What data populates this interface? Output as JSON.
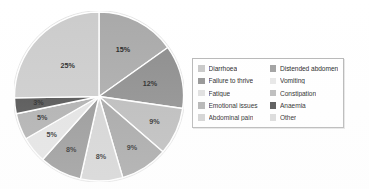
{
  "chart_data": {
    "type": "pie",
    "title": "",
    "subtitle": "",
    "xlabel": "",
    "ylabel": "",
    "grid": false,
    "legend_position": "right",
    "start_angle_deg": 0,
    "direction": "clockwise",
    "categories": [
      "Diarrhoea",
      "Distended abdomen",
      "Failure to thrive",
      "Vomiting",
      "Fatigue",
      "Constipation",
      "Emotional issues",
      "Anaemia",
      "Abdominal pain",
      "Other"
    ],
    "values": [
      15,
      12,
      9,
      9,
      8,
      8,
      5,
      5,
      3,
      25
    ],
    "value_unit": "%",
    "total_labeled": 99,
    "slices": [
      {
        "label": "Diarrhoea",
        "value": 15,
        "value_label": "15%",
        "color": "#a8a8a8"
      },
      {
        "label": "Distended abdomen",
        "value": 12,
        "value_label": "12%",
        "color": "#8a8a8a"
      },
      {
        "label": "Failure to thrive",
        "value": 9,
        "value_label": "9%",
        "color": "#b9b9b9"
      },
      {
        "label": "Vomiting",
        "value": 9,
        "value_label": "9%",
        "color": "#a2a2a2"
      },
      {
        "label": "Fatigue",
        "value": 8,
        "value_label": "8%",
        "color": "#d2d2d2"
      },
      {
        "label": "Constipation",
        "value": 8,
        "value_label": "8%",
        "color": "#939393"
      },
      {
        "label": "Emotional issues",
        "value": 5,
        "value_label": "5%",
        "color": "#e2e2e2"
      },
      {
        "label": "Anaemia",
        "value": 5,
        "value_label": "5%",
        "color": "#acacac"
      },
      {
        "label": "Abdominal pain",
        "value": 3,
        "value_label": "3%",
        "color": "#4a4a4a"
      },
      {
        "label": "Other",
        "value": 25,
        "value_label": "25%",
        "color": "#cbcbcb"
      }
    ]
  },
  "legend": {
    "columns": [
      {
        "items": [
          {
            "label": "Diarrhoea",
            "color": "#c6c6c6"
          },
          {
            "label": "Failure to thrive",
            "color": "#8f8f8f"
          },
          {
            "label": "Fatigue",
            "color": "#dedede"
          },
          {
            "label": "Emotional issues",
            "color": "#b0b0b0"
          },
          {
            "label": "Abdominal pain",
            "color": "#d0d0d0"
          }
        ]
      },
      {
        "items": [
          {
            "label": "Distended abdomen",
            "color": "#9c9c9c"
          },
          {
            "label": "Vomiting",
            "color": "#e6e6e6"
          },
          {
            "label": "Constipation",
            "color": "#b8b8b8"
          },
          {
            "label": "Anaemia",
            "color": "#4a4a4a"
          },
          {
            "label": "Other",
            "color": "#d8d8d8"
          }
        ]
      }
    ]
  },
  "colors": {
    "background": "#ffffff",
    "legend_border": "#b4b4b4",
    "slice_divider": "#ffffff",
    "label_text": "#1c1c1c"
  }
}
